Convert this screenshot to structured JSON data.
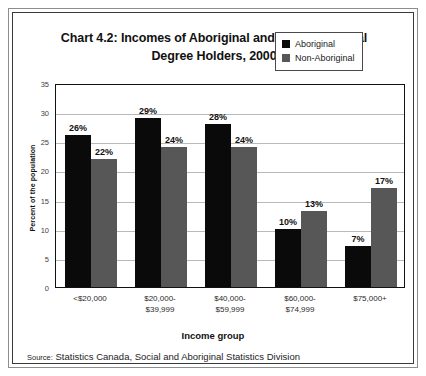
{
  "chart_data": {
    "type": "bar",
    "title": "Chart 4.2: Incomes of Aboriginal and Non-Aboriginal Degree Holders, 2000",
    "title_line1": "Chart 4.2: Incomes of Aboriginal and Non-Aboriginal",
    "title_line2": "Degree Holders, 2000",
    "xlabel": "Income group",
    "ylabel": "Percent of the population",
    "ylim": [
      0,
      35
    ],
    "ytick_values": [
      0,
      5,
      10,
      15,
      20,
      25,
      30,
      35
    ],
    "ytick_labels": [
      "0",
      "5",
      "10",
      "15",
      "20",
      "25",
      "30",
      "35"
    ],
    "grid": true,
    "legend_position": "top-right",
    "categories": [
      "<$20,000",
      "$20,000-$39,999",
      "$40,000-$59,999",
      "$60,000-$74,999",
      "$75,000+"
    ],
    "category_lines": [
      [
        "<$20,000"
      ],
      [
        "$20,000-",
        "$39,999"
      ],
      [
        "$40,000-",
        "$59,999"
      ],
      [
        "$60,000-",
        "$74,999"
      ],
      [
        "$75,000+"
      ]
    ],
    "series": [
      {
        "name": "Aboriginal",
        "color": "#0a0a0a",
        "values": [
          26,
          29,
          28,
          10,
          7
        ],
        "labels": [
          "26%",
          "29%",
          "28%",
          "10%",
          "7%"
        ]
      },
      {
        "name": "Non-Aboriginal",
        "color": "#575757",
        "values": [
          22,
          24,
          24,
          13,
          17
        ],
        "labels": [
          "22%",
          "24%",
          "24%",
          "13%",
          "17%"
        ]
      }
    ]
  },
  "source": {
    "prefix": "Source:",
    "text": "Statistics Canada, Social and Aboriginal Statistics Division"
  }
}
